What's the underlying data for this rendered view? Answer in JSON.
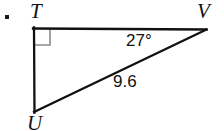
{
  "figure": {
    "kind": "right-triangle-diagram",
    "background_color": "#ffffff",
    "stroke_color": "#111111",
    "right_angle_mark_color": "#8c8c8c",
    "item_marker": ".",
    "vertices": {
      "T": {
        "label": "T",
        "x": 33,
        "y": 28
      },
      "V": {
        "label": "V",
        "x": 206,
        "y": 29
      },
      "U": {
        "label": "U",
        "x": 34,
        "y": 112
      }
    },
    "labels": {
      "vertex_t": "T",
      "vertex_v": "V",
      "vertex_u": "U",
      "angle_at_v": "27°",
      "side_uv_length": "9.6"
    },
    "right_angle_at": "T",
    "sides": [
      {
        "name": "TV",
        "from": "T",
        "to": "V",
        "label": ""
      },
      {
        "name": "TU",
        "from": "T",
        "to": "U",
        "label": ""
      },
      {
        "name": "UV",
        "from": "U",
        "to": "V",
        "label": "9.6"
      }
    ],
    "angles": [
      {
        "at": "V",
        "label": "27°",
        "value": 27,
        "unit": "degrees"
      },
      {
        "at": "T",
        "label": "",
        "value": 90,
        "unit": "degrees"
      }
    ]
  }
}
